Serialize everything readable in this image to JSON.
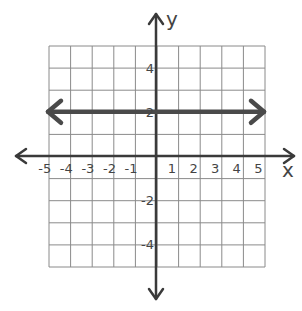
{
  "chart_data": {
    "type": "line",
    "title": "",
    "xlabel": "x",
    "ylabel": "y",
    "xlim": [
      -5,
      5
    ],
    "ylim": [
      -5,
      5
    ],
    "grid": true,
    "x_ticks": [
      "-5",
      "-4",
      "-3",
      "-2",
      "-1",
      "1",
      "2",
      "3",
      "4",
      "5"
    ],
    "y_ticks": [
      "4",
      "2",
      "-2",
      "-4"
    ],
    "series": [
      {
        "name": "y = 2",
        "equation": "y = 2",
        "x": [
          -5,
          5
        ],
        "y": [
          2,
          2
        ],
        "arrows": "both"
      }
    ]
  },
  "labels": {
    "x_axis": "x",
    "y_axis": "y"
  },
  "colors": {
    "grid": "#8a8a8a",
    "axis": "#3a3a3a",
    "line": "#4a4a4a"
  }
}
